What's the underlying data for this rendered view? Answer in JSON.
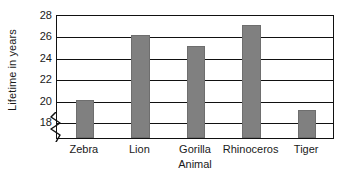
{
  "chart_data": {
    "type": "bar",
    "title": "",
    "categories": [
      "Zebra",
      "Lion",
      "Gorilla",
      "Rhinoceros",
      "Tiger"
    ],
    "values": [
      20,
      26,
      25,
      27,
      19
    ],
    "xlabel": "Animal",
    "ylabel": "Lifetime in years",
    "ylim": [
      16.4,
      28
    ],
    "yticks": [
      18,
      20,
      22,
      24,
      26,
      28
    ],
    "ytick_labels": [
      "18",
      "20",
      "22",
      "24",
      "26",
      "28"
    ],
    "grid": true,
    "grid_axis": "y",
    "legend": false,
    "legend_position": "none",
    "axis_break": true,
    "axis_break_note": "zigzag break on y-axis below 18",
    "bar_color": "#808080",
    "axis_color": "#111111",
    "background_color": "#ffffff",
    "bar_width_ratio": 0.33
  },
  "axes": {
    "y_title": "Lifetime in years",
    "x_title": "Animal"
  }
}
